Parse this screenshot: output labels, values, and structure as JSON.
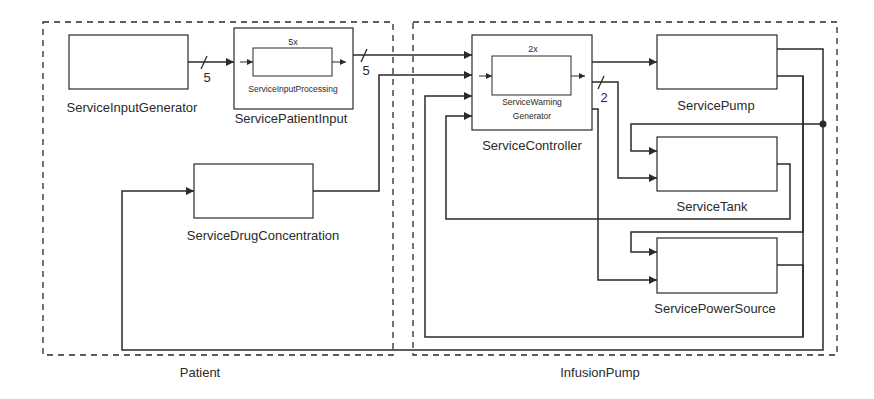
{
  "groups": {
    "patient": {
      "label": "Patient"
    },
    "infusion_pump": {
      "label": "InfusionPump"
    }
  },
  "blocks": {
    "input_generator": {
      "label": "ServiceInputGenerator"
    },
    "patient_input": {
      "label": "ServicePatientInput",
      "inner_label": "ServiceInputProcessing",
      "multiplicity": "5x"
    },
    "drug_concentration": {
      "label": "ServiceDrugConcentration"
    },
    "controller": {
      "label": "ServiceController",
      "inner_label_line1": "ServiceWarning",
      "inner_label_line2": "Generator",
      "multiplicity": "2x"
    },
    "pump": {
      "label": "ServicePump"
    },
    "tank": {
      "label": "ServiceTank"
    },
    "power_source": {
      "label": "ServicePowerSource"
    }
  },
  "bus_widths": {
    "generator_to_patient_input": "5",
    "patient_input_to_controller": "5",
    "controller_to_tank": "2"
  },
  "colors": {
    "line": "#2a2a2a",
    "background": "#ffffff"
  }
}
